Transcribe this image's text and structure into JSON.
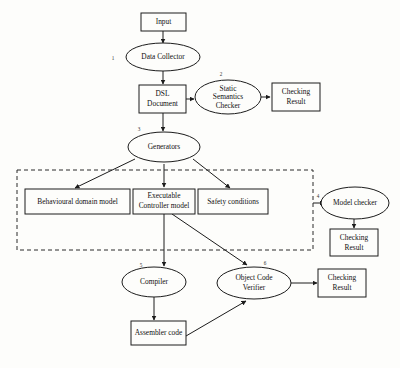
{
  "diagram": {
    "background_color": "#fdfdfb",
    "stroke_color": "#1c1c1c",
    "nodes": {
      "input": {
        "label": "Input",
        "shape": "rect"
      },
      "data_collector": {
        "label": "Data Collector",
        "shape": "ellipse",
        "step": "1"
      },
      "dsl_document": {
        "label_line1": "DSL",
        "label_line2": "Document",
        "shape": "rect"
      },
      "static_semantics_checker": {
        "label_line1": "Static",
        "label_line2": "Semantics",
        "label_line3": "Checker",
        "shape": "ellipse",
        "step": "2"
      },
      "checking_result_top": {
        "label_line1": "Checking",
        "label_line2": "Result",
        "shape": "rect"
      },
      "generators": {
        "label": "Generators",
        "shape": "ellipse",
        "step": "3"
      },
      "behavioural_domain_model": {
        "label": "Behavioural domain model",
        "shape": "rect"
      },
      "executable_controller_model": {
        "label_line1": "Executable",
        "label_line2": "Controller model",
        "shape": "rect"
      },
      "safety_conditions": {
        "label": "Safety conditions",
        "shape": "rect"
      },
      "model_checker": {
        "label": "Model checker",
        "shape": "ellipse",
        "step": "4"
      },
      "checking_result_middle": {
        "label_line1": "Checking",
        "label_line2": "Result",
        "shape": "rect"
      },
      "compiler": {
        "label": "Compiler",
        "shape": "ellipse",
        "step": "5"
      },
      "object_code_verifier": {
        "label_line1": "Object Code",
        "label_line2": "Verifier",
        "shape": "ellipse",
        "step": "6"
      },
      "checking_result_bottom": {
        "label_line1": "Checking",
        "label_line2": "Result",
        "shape": "rect"
      },
      "assembler_code": {
        "label": "Assembler code",
        "shape": "rect"
      }
    },
    "group": {
      "name": "generated-artifacts-group",
      "style": "dashed"
    },
    "edges": [
      {
        "from": "input",
        "to": "data_collector"
      },
      {
        "from": "data_collector",
        "to": "dsl_document"
      },
      {
        "from": "dsl_document",
        "to": "static_semantics_checker"
      },
      {
        "from": "static_semantics_checker",
        "to": "checking_result_top"
      },
      {
        "from": "dsl_document",
        "to": "generators"
      },
      {
        "from": "generators",
        "to": "behavioural_domain_model"
      },
      {
        "from": "generators",
        "to": "executable_controller_model"
      },
      {
        "from": "generators",
        "to": "safety_conditions"
      },
      {
        "from": "generated-artifacts-group",
        "to": "model_checker"
      },
      {
        "from": "model_checker",
        "to": "checking_result_middle"
      },
      {
        "from": "executable_controller_model",
        "to": "compiler"
      },
      {
        "from": "executable_controller_model",
        "to": "object_code_verifier"
      },
      {
        "from": "compiler",
        "to": "assembler_code"
      },
      {
        "from": "assembler_code",
        "to": "object_code_verifier"
      },
      {
        "from": "object_code_verifier",
        "to": "checking_result_bottom"
      }
    ]
  }
}
